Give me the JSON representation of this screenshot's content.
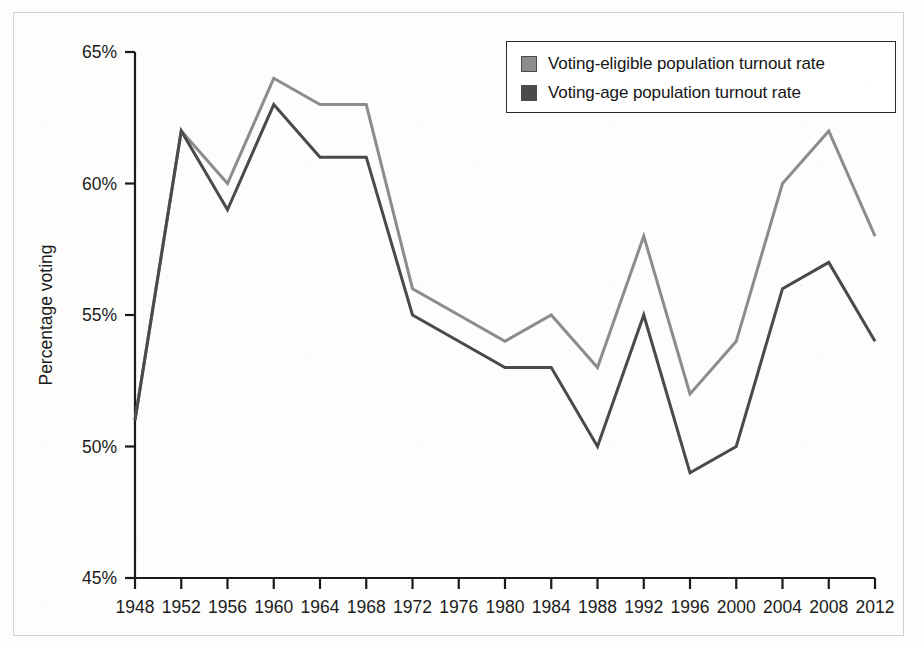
{
  "chart_data": {
    "type": "line",
    "title": "",
    "xlabel": "",
    "ylabel": "Percentage voting",
    "categories": [
      "1948",
      "1952",
      "1956",
      "1960",
      "1964",
      "1968",
      "1972",
      "1976",
      "1980",
      "1984",
      "1988",
      "1992",
      "1996",
      "2000",
      "2004",
      "2008",
      "2012"
    ],
    "x": [
      1948,
      1952,
      1956,
      1960,
      1964,
      1968,
      1972,
      1976,
      1980,
      1984,
      1988,
      1992,
      1996,
      2000,
      2004,
      2008,
      2012
    ],
    "ylim": [
      45,
      65
    ],
    "xlim": [
      1948,
      2012
    ],
    "ytick_labels": [
      "65%",
      "60%",
      "55%",
      "50%",
      "45%"
    ],
    "ytick_values": [
      65,
      60,
      55,
      50,
      45
    ],
    "grid": false,
    "legend_position": "top-right",
    "series": [
      {
        "name": "Voting-eligible population turnout rate",
        "color": "#8c8c8c",
        "values": [
          51,
          62,
          60,
          64,
          63,
          63,
          56,
          55,
          54,
          55,
          53,
          58,
          52,
          54,
          60,
          62,
          58
        ]
      },
      {
        "name": "Voting-age population turnout rate",
        "color": "#4a4a4a",
        "values": [
          51,
          62,
          59,
          63,
          61,
          61,
          55,
          54,
          53,
          53,
          50,
          55,
          49,
          50,
          56,
          57,
          54
        ]
      }
    ]
  },
  "axis": {
    "y_title": "Percentage voting",
    "y_ticks": [
      "65%",
      "60%",
      "55%",
      "50%",
      "45%"
    ],
    "x_ticks": [
      "1948",
      "1952",
      "1956",
      "1960",
      "1964",
      "1968",
      "1972",
      "1976",
      "1980",
      "1984",
      "1988",
      "1992",
      "1996",
      "2000",
      "2004",
      "2008",
      "2012"
    ]
  },
  "legend": {
    "items": [
      {
        "label": "Voting-eligible population turnout rate",
        "color": "#8c8c8c"
      },
      {
        "label": "Voting-age population turnout rate",
        "color": "#4a4a4a"
      }
    ]
  },
  "colors": {
    "eligible_line": "#8c8c8c",
    "age_line": "#4a4a4a",
    "axis": "#1b1b1b",
    "frame": "#d2d2d0",
    "background": "#fdfdfc"
  }
}
